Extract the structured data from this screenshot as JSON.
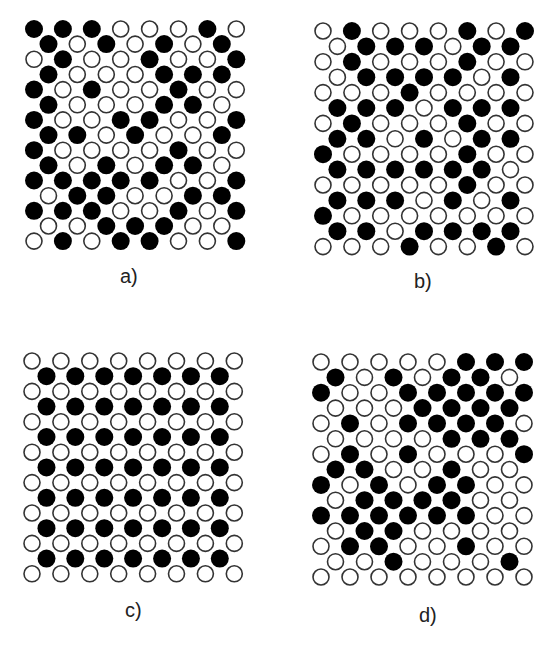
{
  "figure": {
    "colors": {
      "filled": "#000000",
      "empty_fill": "#ffffff",
      "empty_stroke": "#333333"
    },
    "panels": [
      {
        "id": "a",
        "label": "a)",
        "origin": [
          34,
          29
        ],
        "dx": 28.9,
        "dy": 15.15,
        "label_pos": [
          120,
          265
        ],
        "rows": [
          [
            1,
            1,
            1,
            0,
            0,
            0,
            1,
            0
          ],
          [
            1,
            0,
            1,
            0,
            1,
            0,
            1
          ],
          [
            0,
            1,
            0,
            0,
            1,
            0,
            0,
            1
          ],
          [
            1,
            0,
            0,
            0,
            1,
            1,
            1
          ],
          [
            1,
            0,
            1,
            0,
            0,
            1,
            0,
            0
          ],
          [
            1,
            0,
            0,
            0,
            1,
            1,
            0
          ],
          [
            1,
            0,
            0,
            1,
            1,
            0,
            0,
            1
          ],
          [
            1,
            1,
            0,
            1,
            0,
            0,
            1
          ],
          [
            1,
            0,
            0,
            0,
            0,
            1,
            0,
            0
          ],
          [
            1,
            0,
            1,
            0,
            1,
            1,
            0
          ],
          [
            1,
            1,
            1,
            1,
            1,
            0,
            0,
            1
          ],
          [
            0,
            1,
            1,
            0,
            0,
            1,
            1
          ],
          [
            1,
            1,
            1,
            0,
            0,
            1,
            0,
            1
          ],
          [
            0,
            0,
            1,
            1,
            1,
            0,
            0
          ],
          [
            0,
            1,
            0,
            1,
            1,
            0,
            0,
            1
          ]
        ]
      },
      {
        "id": "b",
        "label": "b)",
        "origin": [
          323,
          31
        ],
        "dx": 28.85,
        "dy": 15.4,
        "label_pos": [
          414,
          270
        ],
        "rows": [
          [
            0,
            1,
            0,
            0,
            0,
            1,
            0,
            1
          ],
          [
            0,
            1,
            1,
            1,
            0,
            1,
            1
          ],
          [
            0,
            1,
            0,
            0,
            0,
            1,
            0,
            0
          ],
          [
            0,
            1,
            1,
            1,
            1,
            0,
            1
          ],
          [
            0,
            0,
            0,
            1,
            0,
            0,
            0,
            0
          ],
          [
            1,
            1,
            1,
            0,
            1,
            1,
            1
          ],
          [
            0,
            1,
            0,
            0,
            0,
            1,
            0,
            0
          ],
          [
            1,
            1,
            0,
            1,
            0,
            1,
            1
          ],
          [
            1,
            0,
            0,
            0,
            0,
            1,
            0,
            0
          ],
          [
            1,
            1,
            1,
            1,
            1,
            1,
            0
          ],
          [
            0,
            0,
            0,
            0,
            0,
            1,
            0,
            0
          ],
          [
            1,
            1,
            1,
            0,
            1,
            0,
            1
          ],
          [
            1,
            0,
            0,
            0,
            0,
            0,
            0,
            0
          ],
          [
            1,
            1,
            0,
            1,
            1,
            1,
            1
          ],
          [
            0,
            0,
            0,
            1,
            0,
            0,
            1,
            0
          ]
        ]
      },
      {
        "id": "c",
        "label": "c)",
        "origin": [
          32,
          361
        ],
        "dx": 28.9,
        "dy": 15.2,
        "label_pos": [
          125,
          599
        ],
        "rows": [
          [
            0,
            0,
            0,
            0,
            0,
            0,
            0,
            0
          ],
          [
            1,
            1,
            1,
            1,
            1,
            1,
            1
          ],
          [
            0,
            0,
            0,
            0,
            0,
            0,
            0,
            0
          ],
          [
            1,
            1,
            1,
            1,
            1,
            1,
            1
          ],
          [
            0,
            0,
            0,
            0,
            0,
            0,
            0,
            0
          ],
          [
            1,
            1,
            1,
            1,
            1,
            1,
            1
          ],
          [
            0,
            0,
            0,
            0,
            0,
            0,
            0,
            0
          ],
          [
            1,
            1,
            1,
            1,
            1,
            1,
            1
          ],
          [
            0,
            0,
            0,
            0,
            0,
            0,
            0,
            0
          ],
          [
            1,
            1,
            1,
            1,
            1,
            1,
            1
          ],
          [
            0,
            0,
            0,
            0,
            0,
            0,
            0,
            0
          ],
          [
            1,
            1,
            1,
            1,
            1,
            1,
            1
          ],
          [
            0,
            0,
            0,
            0,
            0,
            0,
            0,
            0
          ],
          [
            1,
            1,
            1,
            1,
            1,
            1,
            1
          ],
          [
            0,
            0,
            0,
            0,
            0,
            0,
            0,
            0
          ]
        ]
      },
      {
        "id": "d",
        "label": "d)",
        "origin": [
          321,
          362
        ],
        "dx": 29.0,
        "dy": 15.36,
        "label_pos": [
          419,
          604
        ],
        "rows": [
          [
            0,
            0,
            0,
            0,
            0,
            1,
            1,
            1
          ],
          [
            1,
            0,
            1,
            0,
            1,
            1,
            0
          ],
          [
            1,
            0,
            0,
            1,
            1,
            1,
            1,
            1
          ],
          [
            0,
            0,
            0,
            1,
            1,
            1,
            1
          ],
          [
            0,
            1,
            0,
            1,
            1,
            1,
            1,
            0
          ],
          [
            0,
            0,
            0,
            0,
            1,
            1,
            1
          ],
          [
            0,
            1,
            0,
            1,
            0,
            0,
            0,
            1
          ],
          [
            1,
            1,
            0,
            0,
            1,
            0,
            0
          ],
          [
            1,
            0,
            1,
            0,
            1,
            1,
            0,
            0
          ],
          [
            0,
            1,
            1,
            1,
            1,
            0,
            0
          ],
          [
            1,
            1,
            1,
            1,
            1,
            1,
            0,
            0
          ],
          [
            0,
            1,
            1,
            0,
            0,
            0,
            0
          ],
          [
            0,
            1,
            1,
            0,
            0,
            1,
            0,
            0
          ],
          [
            0,
            0,
            1,
            0,
            0,
            0,
            1
          ],
          [
            0,
            0,
            0,
            0,
            0,
            0,
            0,
            0
          ]
        ]
      }
    ]
  },
  "labels": {
    "a": "a)",
    "b": "b)",
    "c": "c)",
    "d": "d)"
  }
}
